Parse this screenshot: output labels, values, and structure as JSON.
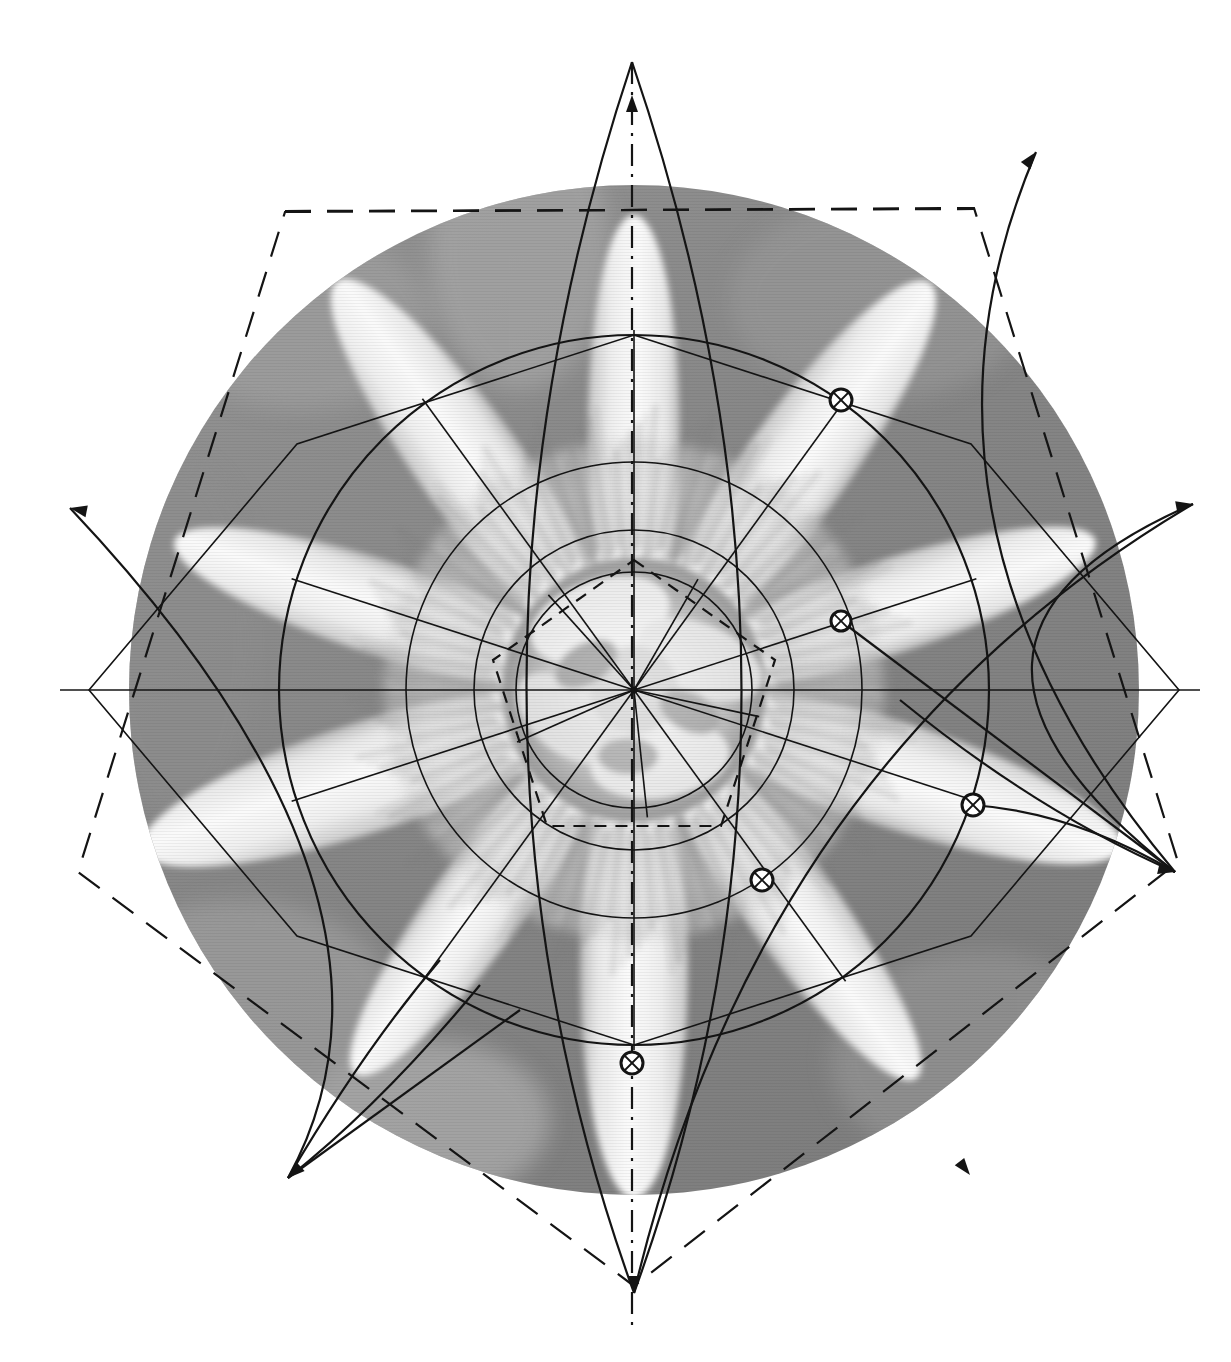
{
  "page": {
    "title": "Geometric construction overlay on passion flower photograph",
    "background_color": "#ffffff",
    "width": 1231,
    "height": 1362
  },
  "photograph": {
    "subject": "passion-flower",
    "description": "Black and white photograph of a passion flower (Passiflora) viewed face-on, showing radiating filaments, five petals and five sepals",
    "shape": "circle",
    "center": [
      634,
      690
    ],
    "radius": 505,
    "background_tone": "#8a8a8a",
    "petal_tone": "#f0f0f0",
    "shadow_tone": "#6e6e6e",
    "filament_tone": "#d9d9d9"
  },
  "overlay": {
    "stroke_color": "#141414",
    "line_width_thin": 1.6,
    "line_width_medium": 2.2,
    "line_width_heavy": 3.0,
    "dash_pattern_long": "26 16",
    "dash_pattern_short": "12 9",
    "dash_pattern_dashdot": "22 8 3 8",
    "center_point": [
      634,
      690
    ]
  },
  "geometry": {
    "center": {
      "x": 634,
      "y": 690,
      "label": "center-point"
    },
    "circles": [
      {
        "name": "inner-circle-1",
        "cx": 634,
        "cy": 690,
        "r": 118,
        "dashed": false
      },
      {
        "name": "inner-circle-2",
        "cx": 634,
        "cy": 690,
        "r": 160,
        "dashed": false
      },
      {
        "name": "middle-circle",
        "cx": 634,
        "cy": 690,
        "r": 228,
        "dashed": false
      },
      {
        "name": "outer-circle",
        "cx": 634,
        "cy": 690,
        "r": 355,
        "dashed": false
      }
    ],
    "pentagon_outer_solid": {
      "name": "outer-solid-pentagon",
      "circumradius": 355,
      "rotation_deg": -90,
      "vertices": [
        [
          634,
          335
        ],
        [
          971,
          444
        ],
        [
          1179,
          690
        ],
        [
          971,
          936
        ],
        [
          634,
          1045
        ],
        [
          297,
          936
        ],
        [
          89,
          690
        ],
        [
          297,
          444
        ]
      ]
    },
    "pentagram_points": [
      {
        "name": "star-point-top",
        "x": 632,
        "y": 95
      },
      {
        "name": "star-point-upper-right",
        "x": 1036,
        "y": 152
      },
      {
        "name": "star-point-right",
        "x": 1193,
        "y": 504
      },
      {
        "name": "star-point-lower-right",
        "x": 1175,
        "y": 872
      },
      {
        "name": "star-point-bottom",
        "x": 634,
        "y": 1293
      },
      {
        "name": "star-point-lower-left",
        "x": 288,
        "y": 1178
      },
      {
        "name": "star-point-left",
        "x": 70,
        "y": 508
      },
      {
        "name": "star-point-far-left",
        "x": 77,
        "y": 878
      }
    ],
    "dashed_pentagon_outer": {
      "name": "outer-dashed-pentagon",
      "vertices": [
        [
          285,
          212
        ],
        [
          974,
          208
        ],
        [
          1178,
          862
        ],
        [
          634,
          1286
        ],
        [
          78,
          872
        ]
      ]
    },
    "dashed_pentagon_inner": {
      "name": "inner-dashed-pentagon",
      "circumradius": 148,
      "rotation_deg": -90,
      "vertices": [
        [
          634,
          560
        ],
        [
          775,
          660
        ],
        [
          721,
          826
        ],
        [
          547,
          826
        ],
        [
          493,
          660
        ]
      ]
    },
    "intersection_markers": [
      {
        "name": "marker-upper-right",
        "x": 841,
        "y": 400,
        "r": 11,
        "glyph": "circled-x"
      },
      {
        "name": "marker-right",
        "x": 841,
        "y": 621,
        "r": 10,
        "glyph": "circled-x"
      },
      {
        "name": "marker-lower-right",
        "x": 973,
        "y": 805,
        "r": 11,
        "glyph": "circled-x"
      },
      {
        "name": "marker-lower-mid",
        "x": 762,
        "y": 880,
        "r": 11,
        "glyph": "circled-x"
      },
      {
        "name": "marker-bottom",
        "x": 632,
        "y": 1063,
        "r": 11,
        "glyph": "circled-x"
      }
    ],
    "axis_lines": [
      {
        "name": "vertical-axis",
        "x1": 632,
        "y1": 62,
        "x2": 632,
        "y2": 1330,
        "style": "dashdot"
      },
      {
        "name": "horizontal-dashed-top",
        "x1": 285,
        "y1": 211,
        "x2": 974,
        "y2": 209,
        "style": "dashed"
      }
    ],
    "convergence_vertex_right": {
      "name": "right-convergence-vertex",
      "x": 1175,
      "y": 872
    },
    "convergence_vertex_left": {
      "name": "left-convergence-vertex",
      "x": 288,
      "y": 1178
    }
  },
  "chart_data": {
    "type": "diagram",
    "symmetry_order": 5,
    "marker_count": 5,
    "circle_count": 4,
    "polygon_count": 3
  }
}
